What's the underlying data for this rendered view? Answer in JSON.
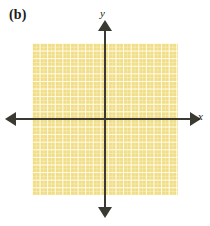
{
  "figure": {
    "panel_label": "(b)",
    "colors": {
      "shading_fill": "#f0dd86",
      "grid_line": "#fffce4",
      "axis": "#3a3a32",
      "text": "#1a1a1a",
      "background": "#ffffff"
    }
  },
  "chart_data": {
    "type": "scatter",
    "title": "(b)",
    "xlabel": "x",
    "ylabel": "y",
    "x": [],
    "y": [],
    "series": [
      {
        "name": "shaded-region",
        "shading": "entire-plane",
        "fill": "#f0dd86",
        "values": []
      }
    ],
    "grid": true,
    "grid_spacing": 1,
    "legend": "none",
    "axis_arrows": {
      "x_left": true,
      "x_right": true,
      "y_up": true,
      "y_down": true
    },
    "tick_labels": {
      "x": [],
      "y": []
    },
    "annotations": [
      {
        "text": "(b)",
        "position": "top-left"
      }
    ]
  },
  "axes": {
    "x_label": "x",
    "y_label": "y"
  }
}
